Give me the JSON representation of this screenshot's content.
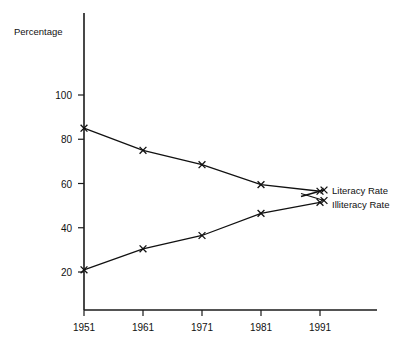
{
  "chart_data": {
    "type": "line",
    "title": "",
    "xlabel": "",
    "ylabel": "Percentage",
    "categories": [
      "1951",
      "1961",
      "1971",
      "1981",
      "1991"
    ],
    "x": [
      1951,
      1961,
      1971,
      1981,
      1991
    ],
    "series": [
      {
        "name": "Literacy Rate",
        "values": [
          85,
          75,
          68.5,
          59.5,
          56.5
        ]
      },
      {
        "name": "Illiteracy Rate",
        "values": [
          21,
          30.5,
          36.5,
          46.5,
          51.5
        ]
      }
    ],
    "ylim": [
      0,
      110
    ],
    "yticks": [
      20,
      40,
      60,
      80,
      100
    ],
    "ytick_labels": [
      "20",
      "40",
      "60",
      "80",
      "100"
    ],
    "xticks": [
      1951,
      1961,
      1971,
      1981,
      1991
    ],
    "grid": false,
    "legend_position": "right-inline",
    "marker": "x",
    "line_color": "#111111"
  },
  "axis": {
    "y_title": "Percentage",
    "y_ticks": [
      "100",
      "80",
      "60",
      "40",
      "20"
    ],
    "x_ticks": [
      "1951",
      "1961",
      "1971",
      "1981",
      "1991"
    ]
  },
  "legend": {
    "entries": [
      {
        "label": "Literacy Rate"
      },
      {
        "label": "Illiteracy Rate"
      }
    ]
  }
}
